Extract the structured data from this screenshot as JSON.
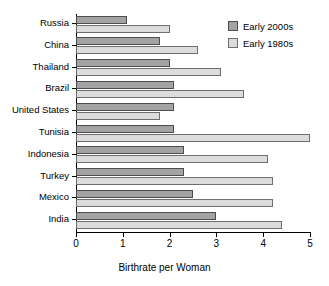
{
  "chart_data": {
    "type": "bar",
    "orientation": "horizontal",
    "title": "",
    "xlabel": "Birthrate per Woman",
    "ylabel": "",
    "xlim": [
      0,
      5
    ],
    "xticks": [
      "0",
      "1",
      "2",
      "3",
      "4",
      "5"
    ],
    "grid": false,
    "legend_position": "top-right",
    "categories": [
      "Russia",
      "China",
      "Thailand",
      "Brazil",
      "United States",
      "Tunisia",
      "Indonesia",
      "Turkey",
      "Mexico",
      "India"
    ],
    "series": [
      {
        "name": "Early 2000s",
        "color": "#a3a3a3",
        "values": [
          1.1,
          1.8,
          2.0,
          2.1,
          2.1,
          2.1,
          2.3,
          2.3,
          2.5,
          3.0
        ]
      },
      {
        "name": "Early 1980s",
        "color": "#dcdcdc",
        "values": [
          2.0,
          2.6,
          3.1,
          3.6,
          1.8,
          5.0,
          4.1,
          4.2,
          4.2,
          4.4
        ]
      }
    ]
  },
  "legend": {
    "items": [
      {
        "label": "Early 2000s",
        "swatch": "recent"
      },
      {
        "label": "Early 1980s",
        "swatch": "older"
      }
    ]
  }
}
